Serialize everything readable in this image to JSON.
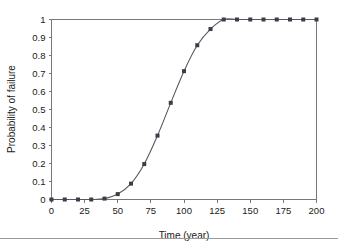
{
  "chart_data": {
    "type": "line",
    "title": "",
    "xlabel": "Time (year)",
    "ylabel": "Probability of failure",
    "xlim": [
      0,
      200
    ],
    "ylim": [
      0,
      1
    ],
    "grid": false,
    "legend": null,
    "marker": "square",
    "marker_color": "#3b3f45",
    "line_color": "#555b63",
    "xticks": [
      0,
      25,
      50,
      75,
      100,
      125,
      150,
      175,
      200
    ],
    "xtick_labels": [
      "0",
      "25",
      "50",
      "75",
      "100",
      "125",
      "150",
      "175",
      "200"
    ],
    "yticks": [
      0,
      0.1,
      0.2,
      0.3,
      0.4,
      0.5,
      0.6,
      0.7,
      0.8,
      0.9,
      1
    ],
    "ytick_labels": [
      "0",
      "0.1",
      "0.2",
      "0.3",
      "0.4",
      "0.5",
      "0.6",
      "0.7",
      "0.8",
      "0.9",
      "1"
    ],
    "x": [
      0,
      10,
      20,
      30,
      40,
      50,
      60,
      70,
      80,
      90,
      100,
      110,
      120,
      130,
      140,
      150,
      160,
      170,
      180,
      190,
      200
    ],
    "values": [
      0,
      0,
      0,
      0,
      0.005,
      0.03,
      0.088,
      0.197,
      0.355,
      0.537,
      0.713,
      0.857,
      0.947,
      1,
      1,
      1,
      1,
      1,
      1,
      1,
      1
    ],
    "series": [
      {
        "name": "Probability of failure",
        "x": [
          0,
          10,
          20,
          30,
          40,
          50,
          60,
          70,
          80,
          90,
          100,
          110,
          120,
          130,
          140,
          150,
          160,
          170,
          180,
          190,
          200
        ],
        "values": [
          0,
          0,
          0,
          0,
          0.005,
          0.03,
          0.088,
          0.197,
          0.355,
          0.537,
          0.713,
          0.857,
          0.947,
          1,
          1,
          1,
          1,
          1,
          1,
          1,
          1
        ]
      }
    ]
  }
}
